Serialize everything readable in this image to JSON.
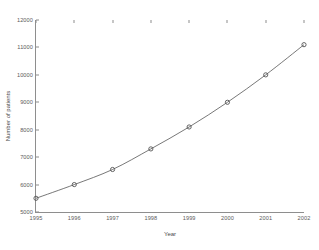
{
  "chart_data": {
    "type": "line",
    "title": "",
    "xlabel": "Year",
    "ylabel": "Number of patients",
    "categories": [
      1995,
      1996,
      1997,
      1998,
      1999,
      2000,
      2001,
      2002
    ],
    "x": [
      1995,
      1996,
      1997,
      1998,
      1999,
      2000,
      2001,
      2002
    ],
    "values": [
      5500,
      6000,
      6550,
      7300,
      8100,
      9000,
      10000,
      11100
    ],
    "series": [
      {
        "name": "Number of patients",
        "values": [
          5500,
          6000,
          6550,
          7300,
          8100,
          9000,
          10000,
          11100
        ]
      }
    ],
    "xlim": [
      1995,
      2002
    ],
    "ylim": [
      5000,
      12000
    ],
    "xticks": [
      1995,
      1996,
      1997,
      1998,
      1999,
      2000,
      2001,
      2002
    ],
    "xtick_labels": [
      "1995",
      "1996",
      "1997",
      "1998",
      "1999",
      "2000",
      "2001",
      "2002"
    ],
    "yticks": [
      5000,
      6000,
      7000,
      8000,
      9000,
      10000,
      11000,
      12000
    ],
    "ytick_labels": [
      "5000",
      "6000",
      "7000",
      "8000",
      "9000",
      "10000",
      "11000",
      "12000"
    ],
    "grid": false,
    "legend": null,
    "legend_position": "none",
    "marker": "circle",
    "line_color": "#555555",
    "marker_color": "#555555",
    "axis_color": "#8e8e8e",
    "background_color": "#ffffff"
  }
}
